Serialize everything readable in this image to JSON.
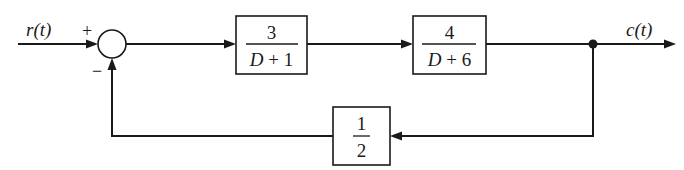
{
  "diagram": {
    "type": "feedback-block-diagram",
    "input": {
      "label": "r(t)"
    },
    "summing_junction": {
      "plus_sign": "+",
      "minus_sign": "−"
    },
    "forward_blocks": [
      {
        "numerator": "3",
        "denominator": "D + 1"
      },
      {
        "numerator": "4",
        "denominator": "D + 6"
      }
    ],
    "feedback_block": {
      "numerator": "1",
      "denominator": "2"
    },
    "output": {
      "label": "c(t)"
    },
    "colors": {
      "line": "#1a1a1a",
      "background": "#ffffff"
    }
  }
}
